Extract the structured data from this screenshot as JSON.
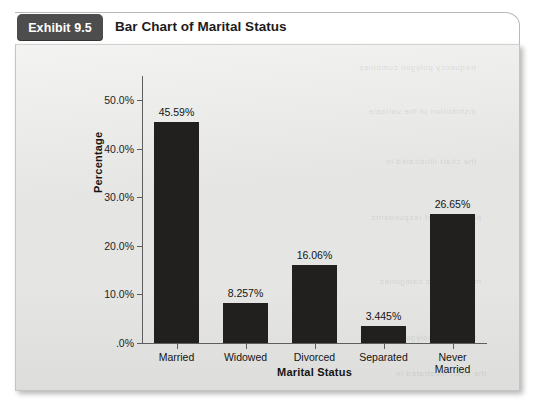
{
  "exhibit": {
    "tab_label": "Exhibit 9.5",
    "title": "Bar Chart of Marital Status"
  },
  "chart_data": {
    "type": "bar",
    "title": "Bar Chart of Marital Status",
    "xlabel": "Marital Status",
    "ylabel": "Percentage",
    "categories": [
      "Married",
      "Widowed",
      "Divorced",
      "Separated",
      "Never\nMarried"
    ],
    "values": [
      45.59,
      8.257,
      16.06,
      3.445,
      26.65
    ],
    "data_labels": [
      "45.59%",
      "8.257%",
      "16.06%",
      "3.445%",
      "26.65%"
    ],
    "ylim": [
      0,
      55
    ],
    "ytick_values": [
      0,
      10,
      20,
      30,
      40,
      50
    ],
    "ytick_labels": [
      ".0%",
      "10.0%",
      "20.0%",
      "30.0%",
      "40.0%",
      "50.0%"
    ],
    "grid": false,
    "legend": false,
    "bar_color": "#221f1f",
    "plot_background": "#e5e5e3"
  },
  "bleed_text": {
    "lines": [
      "frequency polygon combines",
      "distribution of the variable",
      "the chart illustrated in",
      "percentage of respondents",
      "marital status categories"
    ]
  }
}
